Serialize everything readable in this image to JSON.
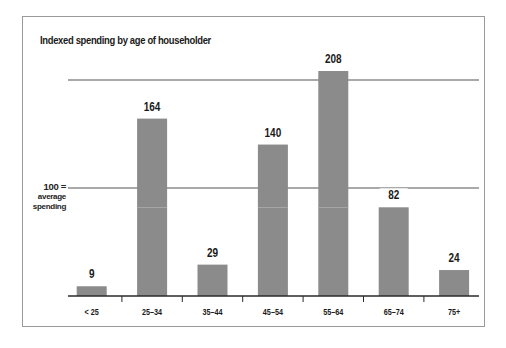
{
  "chart_data": {
    "type": "bar",
    "title": "Indexed spending by age of householder",
    "xlabel": "",
    "ylabel": "",
    "categories": [
      "< 25",
      "25–34",
      "35–44",
      "45–54",
      "55–64",
      "65–74",
      "75+"
    ],
    "values": [
      9,
      164,
      29,
      140,
      208,
      82,
      24
    ],
    "reference_line": {
      "value": 100,
      "label_line1": "100 =",
      "label_line2": "average",
      "label_line3": "spending"
    },
    "ylim": [
      0,
      220
    ],
    "grid": false,
    "data_labels": true,
    "legend": "none",
    "colors": {
      "bar": "#8b8b8b",
      "axis": "#2a2a2a",
      "reference": "#555555",
      "frame": "#9a9a9a"
    }
  },
  "header": {
    "title": "Indexed spending by age of householder"
  },
  "reference": {
    "line1": "100 =",
    "line2": "average",
    "line3": "spending"
  }
}
